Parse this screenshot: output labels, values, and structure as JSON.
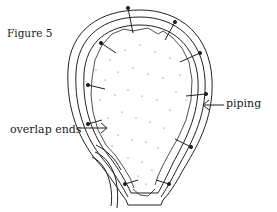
{
  "figure": {
    "title": "Figure 5",
    "labels": {
      "piping": "piping",
      "overlap_ends": "overlap ends"
    },
    "colors": {
      "ink": "#222222",
      "background": "#ffffff",
      "stipple": "#555555"
    }
  }
}
